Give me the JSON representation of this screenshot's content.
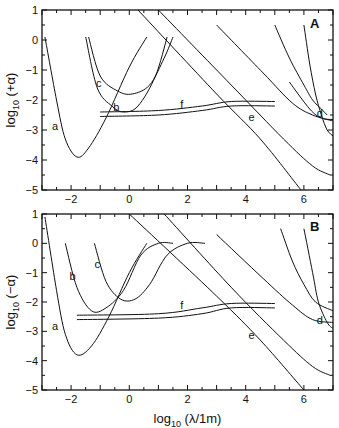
{
  "chart_data": [
    {
      "type": "line",
      "panel": "A",
      "panel_label": "A",
      "ylabel": "log10 (+α)",
      "ylabel_parts": {
        "base": "log",
        "sub": "10",
        "rest": " (+α)"
      },
      "xlabel": "",
      "xlim": [
        -3,
        7
      ],
      "ylim": [
        -5,
        1
      ],
      "x_ticks": [
        "-2",
        "0",
        "2",
        "4",
        "6"
      ],
      "y_ticks": [
        "1",
        "0",
        "-1",
        "-2",
        "-3",
        "-4",
        "-5"
      ],
      "series": [
        {
          "name": "a",
          "points": [
            [
              -2.9,
              0.1
            ],
            [
              -2.5,
              -2.0
            ],
            [
              -2.2,
              -3.3
            ],
            [
              -1.8,
              -3.9
            ],
            [
              -1.4,
              -3.6
            ],
            [
              -0.8,
              -2.6
            ],
            [
              0.0,
              -0.9
            ],
            [
              0.6,
              0.1
            ]
          ]
        },
        {
          "name": "b",
          "points": [
            [
              -1.5,
              0.1
            ],
            [
              -1.1,
              -1.6
            ],
            [
              -0.6,
              -2.2
            ],
            [
              -0.2,
              -2.4
            ],
            [
              0.3,
              -2.2
            ],
            [
              0.9,
              -1.2
            ],
            [
              1.3,
              0.1
            ]
          ]
        },
        {
          "name": "c",
          "points": [
            [
              -1.4,
              0.1
            ],
            [
              -1.0,
              -1.2
            ],
            [
              -0.4,
              -1.7
            ],
            [
              0.1,
              -1.8
            ],
            [
              0.7,
              -1.5
            ],
            [
              1.2,
              -0.6
            ],
            [
              1.5,
              0.1
            ]
          ]
        },
        {
          "name": "f",
          "points": [
            [
              -1.0,
              -2.4
            ],
            [
              1.0,
              -2.35
            ],
            [
              2.5,
              -2.2
            ],
            [
              3.5,
              -2.05
            ],
            [
              5.0,
              -2.05
            ]
          ]
        },
        {
          "name": "f_lower",
          "points": [
            [
              -1.0,
              -2.55
            ],
            [
              1.0,
              -2.5
            ],
            [
              2.5,
              -2.35
            ],
            [
              3.5,
              -2.2
            ],
            [
              5.0,
              -2.2
            ]
          ]
        },
        {
          "name": "e",
          "points": [
            [
              0.3,
              1.0
            ],
            [
              3.0,
              -1.8
            ],
            [
              4.5,
              -3.3
            ],
            [
              5.9,
              -5.0
            ]
          ]
        },
        {
          "name": "e_upper1",
          "points": [
            [
              1.0,
              1.0
            ],
            [
              3.5,
              -1.5
            ],
            [
              5.3,
              -3.3
            ],
            [
              6.3,
              -4.2
            ],
            [
              6.9,
              -4.5
            ]
          ]
        },
        {
          "name": "e_upper2",
          "points": [
            [
              3.0,
              0.5
            ],
            [
              4.6,
              -1.1
            ],
            [
              5.6,
              -2.1
            ],
            [
              6.3,
              -2.5
            ],
            [
              7.0,
              -2.7
            ]
          ]
        },
        {
          "name": "d",
          "points": [
            [
              5.0,
              0.5
            ],
            [
              5.5,
              -0.6
            ],
            [
              6.0,
              -1.5
            ],
            [
              6.3,
              -2.0
            ],
            [
              6.6,
              -2.3
            ],
            [
              6.8,
              -2.5
            ]
          ]
        },
        {
          "name": "d_right",
          "points": [
            [
              6.0,
              0.5
            ],
            [
              6.2,
              -0.8
            ],
            [
              6.4,
              -1.8
            ],
            [
              6.6,
              -2.5
            ],
            [
              6.8,
              -3.0
            ],
            [
              7.0,
              -3.2
            ]
          ]
        },
        {
          "name": "d_flat",
          "points": [
            [
              5.5,
              -1.4
            ],
            [
              6.2,
              -2.3
            ],
            [
              6.6,
              -2.6
            ],
            [
              7.0,
              -2.65
            ]
          ]
        }
      ],
      "annotations": [
        "a",
        "b",
        "c",
        "d",
        "e",
        "f",
        "A"
      ]
    },
    {
      "type": "line",
      "panel": "B",
      "panel_label": "B",
      "ylabel": "log10 (-α)",
      "ylabel_parts": {
        "base": "log",
        "sub": "10",
        "rest": " (−α)"
      },
      "xlabel": "log10 (λ/1m)",
      "xlabel_parts": {
        "base": "log",
        "sub": "10",
        "rest": " (λ/1m)"
      },
      "xlim": [
        -3,
        7
      ],
      "ylim": [
        -5,
        1
      ],
      "x_ticks": [
        "-2",
        "0",
        "2",
        "4",
        "6"
      ],
      "y_ticks": [
        "1",
        "0",
        "-1",
        "-2",
        "-3",
        "-4",
        "-5"
      ],
      "series": [
        {
          "name": "a",
          "points": [
            [
              -2.9,
              0.9
            ],
            [
              -2.5,
              -1.6
            ],
            [
              -2.2,
              -3.1
            ],
            [
              -1.8,
              -3.8
            ],
            [
              -1.3,
              -3.5
            ],
            [
              -0.7,
              -2.5
            ],
            [
              0.0,
              -1.0
            ],
            [
              0.6,
              0.0
            ]
          ]
        },
        {
          "name": "b",
          "points": [
            [
              -2.2,
              0.0
            ],
            [
              -1.8,
              -1.5
            ],
            [
              -1.3,
              -2.3
            ],
            [
              -0.8,
              -2.2
            ],
            [
              -0.2,
              -1.6
            ],
            [
              0.4,
              -0.4
            ],
            [
              1.0,
              0.0
            ],
            [
              1.5,
              0.0
            ]
          ]
        },
        {
          "name": "c",
          "points": [
            [
              -1.2,
              0.0
            ],
            [
              -0.8,
              -1.3
            ],
            [
              -0.3,
              -1.9
            ],
            [
              0.2,
              -1.9
            ],
            [
              0.7,
              -1.4
            ],
            [
              1.3,
              -0.4
            ],
            [
              2.0,
              0.0
            ],
            [
              2.6,
              0.0
            ]
          ]
        },
        {
          "name": "f",
          "points": [
            [
              -1.8,
              -2.45
            ],
            [
              1.0,
              -2.4
            ],
            [
              2.5,
              -2.2
            ],
            [
              3.5,
              -2.05
            ],
            [
              5.0,
              -2.05
            ]
          ]
        },
        {
          "name": "f_lower",
          "points": [
            [
              -1.8,
              -2.6
            ],
            [
              1.0,
              -2.55
            ],
            [
              2.5,
              -2.4
            ],
            [
              3.5,
              -2.2
            ],
            [
              5.0,
              -2.2
            ]
          ]
        },
        {
          "name": "e",
          "points": [
            [
              0.0,
              1.0
            ],
            [
              3.0,
              -1.8
            ],
            [
              4.5,
              -3.3
            ],
            [
              6.0,
              -5.0
            ]
          ]
        },
        {
          "name": "e_upper1",
          "points": [
            [
              1.2,
              1.0
            ],
            [
              3.5,
              -1.5
            ],
            [
              5.3,
              -3.3
            ],
            [
              6.3,
              -4.2
            ],
            [
              6.9,
              -4.5
            ]
          ]
        },
        {
          "name": "e_upper2",
          "points": [
            [
              3.0,
              0.3
            ],
            [
              4.6,
              -1.2
            ],
            [
              5.6,
              -2.1
            ],
            [
              6.3,
              -2.6
            ],
            [
              7.0,
              -2.7
            ]
          ]
        },
        {
          "name": "d",
          "points": [
            [
              5.2,
              0.5
            ],
            [
              5.6,
              -0.6
            ],
            [
              6.0,
              -1.4
            ],
            [
              6.4,
              -2.0
            ],
            [
              7.0,
              -2.3
            ]
          ]
        },
        {
          "name": "d_right",
          "points": [
            [
              6.0,
              0.5
            ],
            [
              6.3,
              -1.0
            ],
            [
              6.5,
              -2.0
            ],
            [
              6.8,
              -2.7
            ],
            [
              7.0,
              -2.9
            ]
          ]
        }
      ],
      "annotations": [
        "a",
        "b",
        "c",
        "d",
        "e",
        "f",
        "B"
      ]
    }
  ]
}
